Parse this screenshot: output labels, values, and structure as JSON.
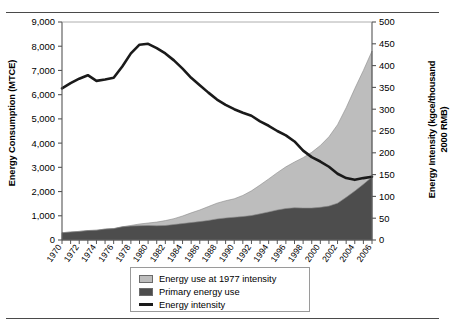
{
  "chart_data": {
    "type": "area",
    "title": "",
    "xlabel": "",
    "ylabel": "Energy Consumption (MTCE)",
    "y2label": "Energy Intensity (kgce/thousand 2000 RMB)",
    "grid": false,
    "legend_position": "bottom-center",
    "xlim": [
      1970,
      2006
    ],
    "ylim": [
      0,
      9000
    ],
    "y2lim": [
      0,
      500
    ],
    "ytick_labels": [
      "0",
      "1,000",
      "2,000",
      "3,000",
      "4,000",
      "5,000",
      "6,000",
      "7,000",
      "8,000",
      "9,000"
    ],
    "ytick_values": [
      0,
      1000,
      2000,
      3000,
      4000,
      5000,
      6000,
      7000,
      8000,
      9000
    ],
    "y2tick_labels": [
      "0",
      "50",
      "100",
      "150",
      "200",
      "250",
      "300",
      "350",
      "400",
      "450",
      "500"
    ],
    "y2tick_values": [
      0,
      50,
      100,
      150,
      200,
      250,
      300,
      350,
      400,
      450,
      500
    ],
    "x": [
      1970,
      1971,
      1972,
      1973,
      1974,
      1975,
      1976,
      1977,
      1978,
      1979,
      1980,
      1981,
      1982,
      1983,
      1984,
      1985,
      1986,
      1987,
      1988,
      1989,
      1990,
      1991,
      1992,
      1993,
      1994,
      1995,
      1996,
      1997,
      1998,
      1999,
      2000,
      2001,
      2002,
      2003,
      2004,
      2005,
      2006
    ],
    "xtick_labels": [
      "1970",
      "1972",
      "1974",
      "1976",
      "1978",
      "1980",
      "1982",
      "1984",
      "1986",
      "1988",
      "1990",
      "1992",
      "1994",
      "1996",
      "1998",
      "2000",
      "2002",
      "2004",
      "2006"
    ],
    "series": [
      {
        "name": "Energy use at 1977 intensity",
        "type": "area",
        "color": "#bdbdbd",
        "axis": "left",
        "values": [
          300,
          330,
          355,
          390,
          405,
          450,
          470,
          545,
          600,
          660,
          700,
          740,
          800,
          880,
          990,
          1120,
          1240,
          1380,
          1520,
          1620,
          1700,
          1840,
          2030,
          2270,
          2520,
          2780,
          3020,
          3220,
          3400,
          3620,
          3900,
          4260,
          4760,
          5460,
          6250,
          7000,
          7800
        ]
      },
      {
        "name": "Primary energy use",
        "type": "area",
        "color": "#4d4d4d",
        "axis": "left",
        "values": [
          300,
          330,
          355,
          390,
          405,
          450,
          470,
          545,
          575,
          590,
          600,
          590,
          600,
          640,
          680,
          720,
          760,
          810,
          870,
          910,
          940,
          970,
          1010,
          1080,
          1160,
          1240,
          1300,
          1330,
          1320,
          1320,
          1350,
          1400,
          1520,
          1760,
          2020,
          2300,
          2600
        ]
      },
      {
        "name": "Energy intensity",
        "type": "line",
        "color": "#1a1a1a",
        "axis": "right",
        "values": [
          348,
          360,
          370,
          378,
          365,
          368,
          372,
          398,
          428,
          448,
          450,
          440,
          428,
          412,
          393,
          372,
          355,
          338,
          322,
          310,
          300,
          292,
          285,
          272,
          262,
          250,
          240,
          226,
          205,
          190,
          180,
          168,
          152,
          142,
          138,
          142,
          145
        ]
      }
    ]
  },
  "legend": {
    "items": [
      {
        "label": "Energy use at 1977 intensity",
        "kind": "swatch",
        "color": "#bdbdbd"
      },
      {
        "label": "Primary energy use",
        "kind": "swatch",
        "color": "#4d4d4d"
      },
      {
        "label": "Energy intensity",
        "kind": "line",
        "color": "#1a1a1a"
      }
    ]
  }
}
